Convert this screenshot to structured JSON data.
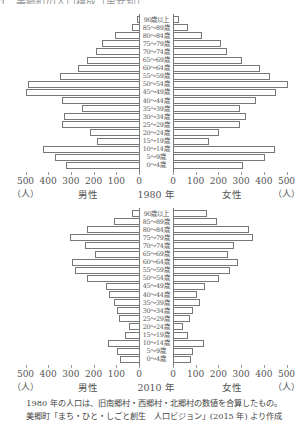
{
  "header_cut_text": "1　美郷町の人口構成（男女別）",
  "age_groups": [
    "90歳以上",
    "85〜89歳",
    "80〜84歳",
    "75〜79歳",
    "70〜74歳",
    "65〜69歳",
    "60〜64歳",
    "55〜59歳",
    "50〜54歳",
    "45〜49歳",
    "40〜44歳",
    "35〜39歳",
    "30〜34歳",
    "25〜29歳",
    "20〜24歳",
    "15〜19歳",
    "10〜14歳",
    "5〜9歳",
    "0〜4歳"
  ],
  "axis": {
    "ticks_left": [
      "500",
      "400",
      "300",
      "200",
      "100",
      "0"
    ],
    "ticks_right": [
      "0",
      "100",
      "200",
      "300",
      "400",
      "500"
    ],
    "unit": "（人）",
    "male_label": "男性",
    "female_label": "女性"
  },
  "charts": [
    {
      "year_label": "1980 年"
    },
    {
      "year_label": "2010 年"
    }
  ],
  "notes": [
    "1980 年の人口は、旧南郷村・西郷村・北郷村の数値を合算したもの。",
    "美郷町「まち・ひと・しごと創生　人口ビジョン」(2015 年) より作成"
  ],
  "chart_data": [
    {
      "type": "bar",
      "subtype": "population-pyramid",
      "title": "1980 年",
      "categories": [
        "90歳以上",
        "85〜89歳",
        "80〜84歳",
        "75〜79歳",
        "70〜74歳",
        "65〜69歳",
        "60〜64歳",
        "55〜59歳",
        "50〜54歳",
        "45〜49歳",
        "40〜44歳",
        "35〜39歳",
        "30〜34歳",
        "25〜29歳",
        "20〜24歳",
        "15〜19歳",
        "10〜14歳",
        "5〜9歳",
        "0〜4歳"
      ],
      "series": [
        {
          "name": "男性",
          "values": [
            5,
            30,
            105,
            165,
            190,
            230,
            270,
            350,
            490,
            500,
            340,
            250,
            330,
            340,
            215,
            185,
            425,
            370,
            320
          ]
        },
        {
          "name": "女性",
          "values": [
            20,
            60,
            125,
            205,
            235,
            300,
            380,
            425,
            500,
            450,
            360,
            290,
            315,
            290,
            200,
            155,
            445,
            400,
            305
          ]
        }
      ],
      "xlabel": "（人）",
      "xlim": [
        0,
        500
      ],
      "xticks": [
        0,
        100,
        200,
        300,
        400,
        500
      ],
      "grid": false,
      "legend": "none"
    },
    {
      "type": "bar",
      "subtype": "population-pyramid",
      "title": "2010 年",
      "categories": [
        "90歳以上",
        "85〜89歳",
        "80〜84歳",
        "75〜79歳",
        "70〜74歳",
        "65〜69歳",
        "60〜64歳",
        "55〜59歳",
        "50〜54歳",
        "45〜49歳",
        "40〜44歳",
        "35〜39歳",
        "30〜34歳",
        "25〜29歳",
        "20〜24歳",
        "15〜19歳",
        "10〜14歳",
        "5〜9歳",
        "0〜4歳"
      ],
      "series": [
        {
          "name": "男性",
          "values": [
            30,
            110,
            230,
            305,
            240,
            195,
            295,
            280,
            230,
            145,
            130,
            110,
            95,
            90,
            45,
            60,
            135,
            95,
            85
          ]
        },
        {
          "name": "女性",
          "values": [
            145,
            190,
            330,
            350,
            265,
            240,
            280,
            245,
            200,
            135,
            100,
            115,
            85,
            70,
            40,
            60,
            130,
            85,
            75
          ]
        }
      ],
      "xlabel": "（人）",
      "xlim": [
        0,
        500
      ],
      "xticks": [
        0,
        100,
        200,
        300,
        400,
        500
      ],
      "grid": false,
      "legend": "none"
    }
  ]
}
